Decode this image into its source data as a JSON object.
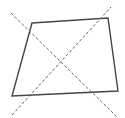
{
  "diagram": {
    "width": 125,
    "height": 118,
    "background": "#ffffff",
    "quadrilateral": {
      "points": "32,23 108,18 118,91 12,96",
      "stroke": "#444444",
      "stroke_width": 1.4
    },
    "dashed_lines": [
      {
        "x1": 11,
        "y1": 13,
        "x2": 117,
        "y2": 117,
        "stroke": "#666666",
        "dash": "3,2"
      },
      {
        "x1": 12,
        "y1": 115,
        "x2": 111,
        "y2": 7,
        "stroke": "#666666",
        "dash": "3,2"
      }
    ]
  }
}
